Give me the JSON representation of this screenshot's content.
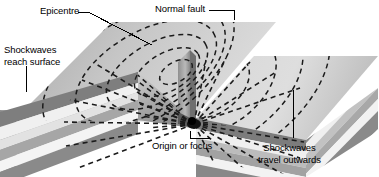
{
  "diagram": {
    "type": "geological-block-diagram",
    "labels": {
      "epicentre": "Epicentre",
      "normal_fault": "Normal fault",
      "shockwaves_reach_surface": "Shockwaves\nreach surface",
      "origin_or_focus": "Origin or focus",
      "shockwaves_travel_outwards": "Shockwaves\ntravel outwards"
    },
    "colors": {
      "background": "#ffffff",
      "text": "#000000",
      "leader_line": "#000000",
      "wave_dash": "#1a1a1a",
      "top_surface_light": "#d9d9d9",
      "top_surface_mid": "#c8c8c8",
      "top_surface_dark": "#b0b0b0",
      "scarp_face": "#8e8e8e",
      "focus_point": "#111111",
      "strata_1": "#8a8a8a",
      "strata_2": "#efefef",
      "strata_3": "#a8a8a8",
      "strata_4": "#f4f4f4",
      "strata_5": "#9a9a9a",
      "strata_6": "#7a7a7a"
    },
    "features": {
      "focus_x": 194,
      "focus_y": 122,
      "ray_count": 13,
      "surface_ring_count": 5,
      "strata_layer_count": 6,
      "blocks": [
        "downthrown-left-block",
        "upthrown-right-block"
      ]
    }
  }
}
